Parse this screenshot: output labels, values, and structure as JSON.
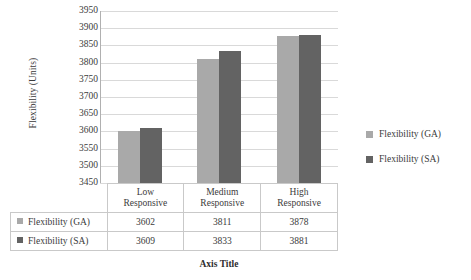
{
  "chart_data": {
    "type": "bar",
    "title": "",
    "xlabel": "Axis Title",
    "ylabel": "Flexibility (Units)",
    "categories": [
      "Low Responsive",
      "Medium Responsive",
      "High Responsive"
    ],
    "category_lines": [
      [
        "Low",
        "Responsive"
      ],
      [
        "Medium",
        "Responsive"
      ],
      [
        "High",
        "Responsive"
      ]
    ],
    "series": [
      {
        "name": "Flexibility (GA)",
        "values": [
          3602,
          3811,
          3878
        ],
        "color": "#a9a9a9"
      },
      {
        "name": "Flexibility (SA)",
        "values": [
          3609,
          3833,
          3881
        ],
        "color": "#636363"
      }
    ],
    "ylim": [
      3450,
      3950
    ],
    "yticks": [
      3450,
      3500,
      3550,
      3600,
      3650,
      3700,
      3750,
      3800,
      3850,
      3900,
      3950
    ],
    "ytick_labels": [
      "3450",
      "3500",
      "3550",
      "3600",
      "3650",
      "3700",
      "3750",
      "3800",
      "3850",
      "3900",
      "3950"
    ],
    "grid": true,
    "legend_position": "right",
    "data_table_visible": true
  },
  "legend": {
    "items": [
      {
        "label": "Flexibility (GA)",
        "color": "#a9a9a9"
      },
      {
        "label": "Flexibility (SA)",
        "color": "#636363"
      }
    ]
  },
  "table": {
    "row_labels": [
      "Flexibility (GA)",
      "Flexibility (SA)"
    ],
    "rows": [
      [
        "3602",
        "3811",
        "3878"
      ],
      [
        "3609",
        "3833",
        "3881"
      ]
    ]
  }
}
